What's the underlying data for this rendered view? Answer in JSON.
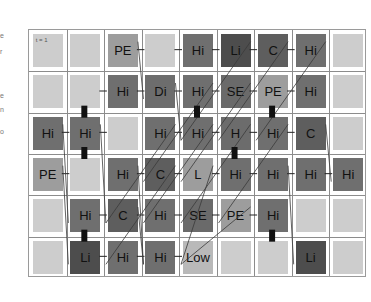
{
  "edge_fragments": [
    "e",
    "r",
    "e",
    "n",
    "o"
  ],
  "time_label": "t = 1",
  "grid": {
    "columns": 9,
    "rows": 6,
    "cells": [
      [
        {
          "label": "",
          "type": "empty",
          "corner": "t = 1"
        },
        {
          "label": "",
          "type": "empty"
        },
        {
          "label": "PE",
          "type": "pe"
        },
        {
          "label": "",
          "type": "empty"
        },
        {
          "label": "Hi",
          "type": "hi"
        },
        {
          "label": "Li",
          "type": "li"
        },
        {
          "label": "C",
          "type": "c"
        },
        {
          "label": "Hi",
          "type": "hi"
        },
        {
          "label": "",
          "type": "empty"
        }
      ],
      [
        {
          "label": "",
          "type": "empty"
        },
        {
          "label": "",
          "type": "empty"
        },
        {
          "label": "Hi",
          "type": "hi"
        },
        {
          "label": "Di",
          "type": "di"
        },
        {
          "label": "Hi",
          "type": "hi"
        },
        {
          "label": "SE",
          "type": "se"
        },
        {
          "label": "PE",
          "type": "pe"
        },
        {
          "label": "Hi",
          "type": "hi"
        },
        {
          "label": "",
          "type": "empty"
        }
      ],
      [
        {
          "label": "Hi",
          "type": "hi"
        },
        {
          "label": "Hi",
          "type": "hi"
        },
        {
          "label": "",
          "type": "empty"
        },
        {
          "label": "Hi",
          "type": "hi"
        },
        {
          "label": "Hi",
          "type": "hi"
        },
        {
          "label": "H",
          "type": "h"
        },
        {
          "label": "Hi",
          "type": "hi"
        },
        {
          "label": "C",
          "type": "c"
        },
        {
          "label": "",
          "type": "empty"
        }
      ],
      [
        {
          "label": "PE",
          "type": "pe"
        },
        {
          "label": "",
          "type": "empty"
        },
        {
          "label": "Hi",
          "type": "hi"
        },
        {
          "label": "C",
          "type": "c"
        },
        {
          "label": "L",
          "type": "pe"
        },
        {
          "label": "Hi",
          "type": "hi"
        },
        {
          "label": "Hi",
          "type": "hi"
        },
        {
          "label": "Hi",
          "type": "hi"
        },
        {
          "label": "Hi",
          "type": "hi"
        }
      ],
      [
        {
          "label": "",
          "type": "empty"
        },
        {
          "label": "Hi",
          "type": "hi"
        },
        {
          "label": "C",
          "type": "c"
        },
        {
          "label": "Hi",
          "type": "hi"
        },
        {
          "label": "SE",
          "type": "se"
        },
        {
          "label": "PE",
          "type": "pe"
        },
        {
          "label": "Hi",
          "type": "hi"
        },
        {
          "label": "",
          "type": "empty"
        },
        {
          "label": "",
          "type": "empty"
        }
      ],
      [
        {
          "label": "",
          "type": "empty"
        },
        {
          "label": "Li",
          "type": "li"
        },
        {
          "label": "Hi",
          "type": "hi"
        },
        {
          "label": "Hi",
          "type": "hi"
        },
        {
          "label": "Low",
          "type": "low"
        },
        {
          "label": "",
          "type": "empty"
        },
        {
          "label": "",
          "type": "empty"
        },
        {
          "label": "Li",
          "type": "li"
        },
        {
          "label": "",
          "type": "empty"
        }
      ]
    ]
  },
  "colors": {
    "empty": "#cdcdcd",
    "pe": "#9d9d9d",
    "hi": "#6f6f6f",
    "li": "#4d4d4d",
    "low": "#b9b9b9",
    "grid_line": "#8c8c8c",
    "link": "#222222"
  },
  "markers": [
    {
      "row": 2,
      "col": 1,
      "side": "top"
    },
    {
      "row": 2,
      "col": 1,
      "side": "bottom"
    },
    {
      "row": 1,
      "col": 4,
      "side": "bottom"
    },
    {
      "row": 1,
      "col": 6,
      "side": "bottom"
    },
    {
      "row": 2,
      "col": 5,
      "side": "bottom"
    },
    {
      "row": 4,
      "col": 6,
      "side": "bottom"
    },
    {
      "row": 5,
      "col": 1,
      "side": "top"
    }
  ],
  "links_h": [
    [
      0,
      2,
      0,
      3
    ],
    [
      0,
      3,
      0,
      4
    ],
    [
      0,
      4,
      0,
      5
    ],
    [
      0,
      5,
      0,
      6
    ],
    [
      0,
      6,
      0,
      7
    ],
    [
      1,
      1,
      1,
      2
    ],
    [
      1,
      2,
      1,
      3
    ],
    [
      1,
      3,
      1,
      4
    ],
    [
      1,
      4,
      1,
      5
    ],
    [
      1,
      5,
      1,
      6
    ],
    [
      1,
      6,
      1,
      7
    ],
    [
      2,
      0,
      2,
      1
    ],
    [
      2,
      1,
      2,
      2
    ],
    [
      2,
      3,
      2,
      4
    ],
    [
      2,
      4,
      2,
      5
    ],
    [
      2,
      5,
      2,
      6
    ],
    [
      2,
      6,
      2,
      7
    ],
    [
      3,
      0,
      3,
      1
    ],
    [
      3,
      2,
      3,
      3
    ],
    [
      3,
      3,
      3,
      4
    ],
    [
      3,
      4,
      3,
      5
    ],
    [
      3,
      5,
      3,
      6
    ],
    [
      3,
      6,
      3,
      7
    ],
    [
      3,
      7,
      3,
      8
    ],
    [
      4,
      1,
      4,
      2
    ],
    [
      4,
      2,
      4,
      3
    ],
    [
      4,
      3,
      4,
      4
    ],
    [
      4,
      4,
      4,
      5
    ],
    [
      4,
      5,
      4,
      6
    ],
    [
      5,
      1,
      5,
      2
    ],
    [
      5,
      2,
      5,
      3
    ],
    [
      5,
      3,
      5,
      4
    ]
  ],
  "links_diag": [
    [
      0,
      2,
      1,
      3
    ],
    [
      0,
      5,
      2,
      4
    ],
    [
      0,
      6,
      2,
      5
    ],
    [
      0,
      7,
      2,
      6
    ],
    [
      1,
      3,
      2,
      4
    ],
    [
      1,
      4,
      3,
      3
    ],
    [
      1,
      5,
      3,
      4
    ],
    [
      2,
      0,
      4,
      1
    ],
    [
      2,
      1,
      4,
      2
    ],
    [
      2,
      3,
      4,
      2
    ],
    [
      2,
      4,
      4,
      3
    ],
    [
      2,
      5,
      4,
      4
    ],
    [
      2,
      6,
      4,
      5
    ],
    [
      2,
      7,
      3,
      8
    ],
    [
      3,
      0,
      5,
      1
    ],
    [
      3,
      2,
      5,
      3
    ],
    [
      3,
      3,
      5,
      2
    ],
    [
      3,
      4,
      5,
      4
    ],
    [
      3,
      6,
      5,
      7
    ],
    [
      4,
      2,
      5,
      3
    ],
    [
      4,
      5,
      5,
      4
    ]
  ]
}
